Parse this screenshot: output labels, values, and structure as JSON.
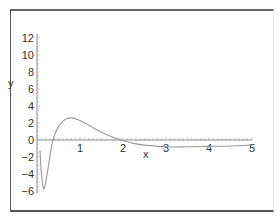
{
  "chart_data": {
    "type": "line",
    "title": "",
    "xlabel": "x",
    "ylabel": "y",
    "xlim": [
      0,
      5
    ],
    "ylim": [
      -6,
      12
    ],
    "grid": false,
    "legend": null,
    "x_ticks": [
      "1",
      "2",
      "3",
      "4",
      "5"
    ],
    "y_ticks": [
      "-6",
      "-4",
      "-2",
      "0",
      "2",
      "4",
      "6",
      "8",
      "10",
      "12"
    ],
    "series": [
      {
        "name": "y(x)",
        "color": "#9a9a9a",
        "x": [
          0.07,
          0.1,
          0.15,
          0.2,
          0.3,
          0.37,
          0.5,
          0.65,
          0.8,
          1.0,
          1.25,
          1.5,
          1.75,
          1.95,
          2.25,
          2.5,
          3.0,
          3.5,
          4.0,
          4.5,
          5.0
        ],
        "y": [
          -1.2,
          -3.8,
          -5.7,
          -5.0,
          -2.0,
          0.0,
          1.6,
          2.4,
          2.6,
          2.3,
          1.6,
          0.9,
          0.35,
          0.0,
          -0.4,
          -0.6,
          -0.8,
          -0.8,
          -0.75,
          -0.7,
          -0.6
        ]
      }
    ]
  },
  "axes": {
    "x_label": "x",
    "y_label": "y"
  }
}
